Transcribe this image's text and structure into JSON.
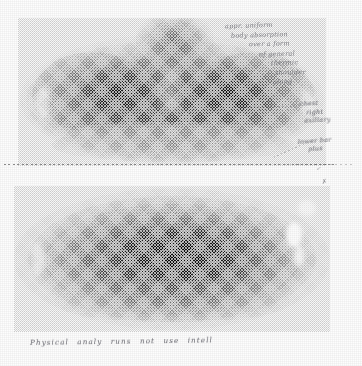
{
  "document": {
    "kind": "scanned-medical-imaging-page",
    "media": "grayscale halftone print on paper",
    "panel_count": 2
  },
  "scans": [
    {
      "id": "upper",
      "name": "upper-scan",
      "view": "anterior thorax / upper torso thermographic scan",
      "description": "Symmetric bilobed dark thermal field across the chest with a narrower neck-shoulder region at top; bright cool margins at the body outline.",
      "orientation": "anterior",
      "grayscale_range": "white (cool) to near-black (hot)"
    },
    {
      "id": "lower",
      "name": "lower-scan",
      "view": "abdomen / lower torso thermographic scan",
      "description": "Large horizontally elongated oval with nested concentric isotherm contour rings converging on a dark central core; a bright hotspot notch on the right flank.",
      "orientation": "anterior",
      "grayscale_range": "white (cool) to near-black (hot)"
    }
  ],
  "annotations": {
    "top_note": {
      "name": "upper-right-handwritten-note",
      "legible": false,
      "lines": [
        "appr. uniform",
        "body absorption",
        "over a form",
        "of general",
        "thermic",
        "shoulder",
        "along"
      ]
    },
    "mid_note": {
      "name": "mid-right-handwritten-note",
      "legible": false,
      "lines": [
        "chest",
        "right",
        "axillary"
      ]
    },
    "lower_right_note": {
      "name": "lower-right-handwritten-note",
      "legible": false,
      "lines": [
        "lower bar",
        "plus"
      ]
    },
    "bottom_note": {
      "name": "bottom-handwritten-caption",
      "legible": false,
      "text": "Physical  analy  runs  not  use  intell"
    },
    "marks": {
      "mark_a": "✓",
      "mark_b": "✗",
      "mark_c": "·"
    }
  },
  "separator": {
    "name": "dotted-divider",
    "style": "dotted horizontal rule between the two scan panels"
  },
  "colors": {
    "paper": "#fdfdfd",
    "ink": "#4a4a52",
    "scan_dark": "#1a1a1a",
    "scan_mid": "#6e6e6e",
    "scan_light": "#d8d8d8"
  }
}
